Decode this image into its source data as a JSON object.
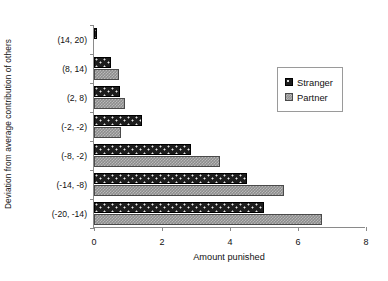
{
  "chart_data": {
    "type": "bar",
    "orientation": "horizontal",
    "title": "",
    "subtitle": "",
    "xlabel": "Amount punished",
    "ylabel": "Deviation from average contribution of others",
    "categories": [
      "(14, 20)",
      "(8, 14)",
      "(2, 8)",
      "(-2, -2)",
      "(-8, -2)",
      "(-14, -8)",
      "(-20, -14)"
    ],
    "series": [
      {
        "name": "Stranger",
        "values": [
          0.1,
          0.5,
          0.75,
          1.4,
          2.85,
          4.5,
          5.0
        ],
        "color": "#1d1d1d"
      },
      {
        "name": "Partner",
        "values": [
          0.0,
          0.73,
          0.9,
          0.8,
          3.7,
          5.6,
          6.7
        ],
        "color": "#8d8d8d"
      }
    ],
    "xlim": [
      0,
      8
    ],
    "xticks": [
      0,
      2,
      4,
      6,
      8
    ],
    "xtick_labels": [
      "0",
      "2",
      "4",
      "6",
      "8"
    ],
    "grid": false,
    "legend_position": "right-upper"
  },
  "legend": {
    "entries": [
      {
        "label": "Stranger",
        "swatch": "stranger"
      },
      {
        "label": "Partner",
        "swatch": "partner"
      }
    ]
  }
}
